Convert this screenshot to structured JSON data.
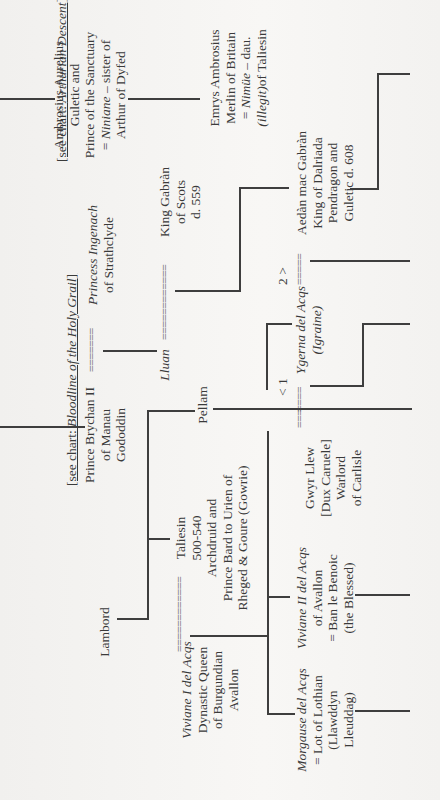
{
  "chart": {
    "title_refs": {
      "bloodline": {
        "prefix": "[see chart: ",
        "italic": "Bloodline of the Holy Grail",
        "suffix": "]"
      },
      "arthurian": {
        "prefix": "[see chart: ",
        "italic": "Arthurian Descent",
        "suffix": "]"
      }
    },
    "nodes": {
      "ambrosius": {
        "lines": [
          "Ambrosius Aurelius",
          "Guletic and",
          "Prince of the Sanctuary"
        ],
        "spouse_italic": "Niniane",
        "spouse_rest": " – sister of",
        "last": "Arthur of Dyfed"
      },
      "emrys": {
        "lines": [
          "Emrys Ambrosius",
          "Merlin of Britain"
        ],
        "spouse_pre": "= ",
        "spouse_italic": "Nimüe",
        "spouse_rest": " – dau.",
        "illegit_italic": "(illegit)",
        "illegit_rest": "of Taliesin"
      },
      "brychan": {
        "lines": [
          "Prince Brychan II",
          "of Manau",
          "Gododdin"
        ]
      },
      "ingenach": {
        "name_italic": "Princess Ingenach",
        "line2": "of Strathclyde"
      },
      "lluan": {
        "name_italic": "Lluan"
      },
      "gabran": {
        "lines": [
          "King Gabràn",
          "of Scots",
          "d. 559"
        ]
      },
      "aedan": {
        "lines": [
          "Aedàn mac Gabràn",
          "King of Dalriada",
          "Pendragon and",
          "Guletic d. 608"
        ]
      },
      "ygerna": {
        "name_italic": "Ygerna del Acqs",
        "alt_italic": "(Igraine)"
      },
      "pellam": {
        "name": "Pellam"
      },
      "lambord": {
        "name": "Lambord"
      },
      "taliesin": {
        "lines": [
          "Taliesin",
          "500-540",
          "Archdruid and",
          "Prince Bard to Urien of",
          "Rheged & Goure (Gowrie)"
        ]
      },
      "viviane1": {
        "name_italic": "Viviane I del Acqs",
        "lines": [
          "Dynastic Queen",
          "of Burgundian",
          "Avallon"
        ]
      },
      "gwyr": {
        "lines": [
          "Gwyr Llew",
          "[Dux Caruele]",
          "Warlord",
          "of Carlisle"
        ]
      },
      "viviane2": {
        "name_italic": "Viviane II del Acqs",
        "lines": [
          "of Avallon",
          "= Ban le Benoic",
          "(the Blessed)"
        ]
      },
      "morgause": {
        "name_italic": "Morgause del Acqs",
        "lines": [
          "= Lot of Lothian",
          "(Llawddyn",
          "Lleuddag)"
        ]
      }
    },
    "marriage_marks": {
      "brychan_ingenach": "=======",
      "lluan_gabran": "============",
      "viviane_taliesin": "============",
      "ygerna_left": "====",
      "ygerna_aedan": "=====",
      "gwyr": "==="
    },
    "marriage_order": {
      "first": "< 1",
      "second": "2 >"
    }
  }
}
